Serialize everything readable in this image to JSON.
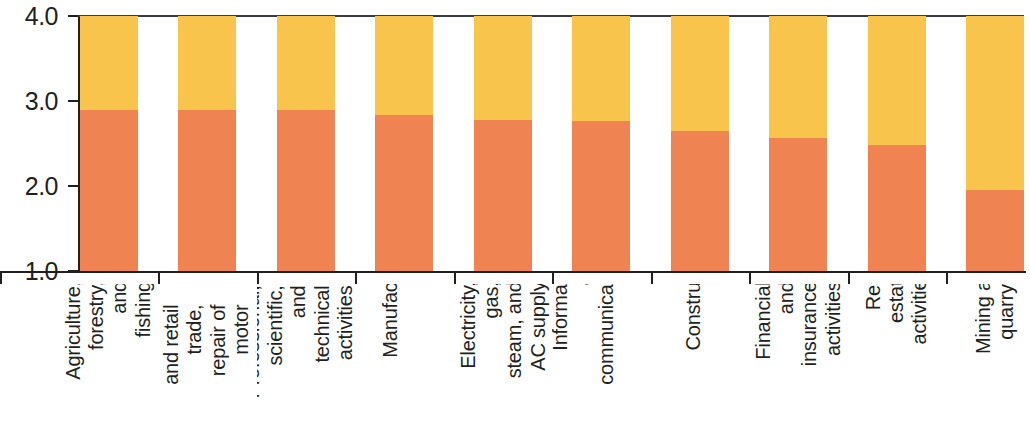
{
  "chart_data": {
    "type": "bar",
    "subtype": "stacked-bar",
    "title": "",
    "subtitle": "",
    "xlabel": "",
    "ylabel": "",
    "ylim": [
      1.0,
      4.0
    ],
    "ytick_labels": [
      "4.0",
      "3.0",
      "2.0",
      "1.0"
    ],
    "ytick_values": [
      4.0,
      3.0,
      2.0,
      1.0
    ],
    "grid": false,
    "legend": "none",
    "bar_baseline": 1.0,
    "bar_cap": 4.0,
    "categories": [
      "Agriculture,\nforestry, and\nfishing",
      "Wholesale\nand retail\ntrade, repair of\nmotor vehicles",
      "Professional,\nscientific,\nand technical\nactivities",
      "Manufacturing",
      "Electricity, gas,\nsteam, and\nAC supply",
      "Information\nand\ncommunication",
      "Construction",
      "Financial and\ninsurance\nactivities",
      "Real estate\nactivities",
      "Mining and\nquarrying"
    ],
    "series": [
      {
        "name": "lower-segment",
        "color": "#EF8351",
        "values": [
          2.9,
          2.9,
          2.9,
          2.83,
          2.78,
          2.77,
          2.65,
          2.57,
          2.48,
          1.95
        ]
      },
      {
        "name": "upper-segment",
        "color": "#F8C44C",
        "values": [
          4.0,
          4.0,
          4.0,
          4.0,
          4.0,
          4.0,
          4.0,
          4.0,
          4.0,
          4.0
        ]
      }
    ],
    "axis_color": "#231F20",
    "top_rule_color": "#3A3A42",
    "background": "#FFFFFF"
  }
}
